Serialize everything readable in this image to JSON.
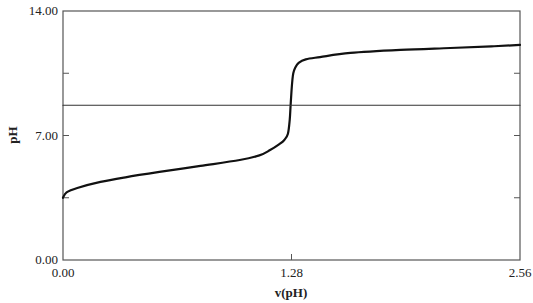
{
  "chart_data": {
    "type": "line",
    "title": "",
    "xlabel": "v(pH)",
    "ylabel": "pH",
    "xlim": [
      0.0,
      2.56
    ],
    "ylim": [
      0.0,
      14.0
    ],
    "x_ticks": [
      0.0,
      1.28,
      2.56
    ],
    "x_tick_labels": [
      "0.00",
      "1.28",
      "2.56"
    ],
    "y_ticks": [
      0.0,
      3.5,
      7.0,
      10.5,
      14.0
    ],
    "y_tick_labels": [
      "0.00",
      "",
      "7.00",
      "",
      "14.00"
    ],
    "grid": false,
    "legend": null,
    "series": [
      {
        "name": "titration curve",
        "color": "#111111",
        "x": [
          0.0,
          0.02,
          0.08,
          0.21,
          0.35,
          0.54,
          0.77,
          0.99,
          1.1,
          1.16,
          1.21,
          1.24,
          1.26,
          1.27,
          1.275,
          1.28,
          1.285,
          1.29,
          1.3,
          1.32,
          1.36,
          1.44,
          1.61,
          1.89,
          2.17,
          2.4,
          2.56
        ],
        "y": [
          3.5,
          3.8,
          4.05,
          4.39,
          4.65,
          4.95,
          5.29,
          5.62,
          5.88,
          6.18,
          6.5,
          6.75,
          7.1,
          7.87,
          8.7,
          9.5,
          10.12,
          10.5,
          10.8,
          11.08,
          11.28,
          11.41,
          11.64,
          11.81,
          11.92,
          12.01,
          12.09
        ]
      },
      {
        "name": "reference line",
        "color": "#333333",
        "x": [
          0.0,
          2.56
        ],
        "y": [
          8.7,
          8.7
        ]
      }
    ]
  }
}
